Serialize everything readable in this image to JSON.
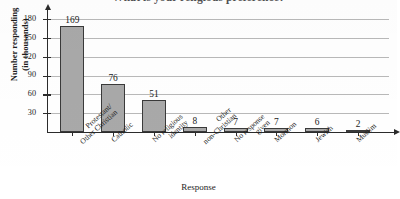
{
  "chart_data": {
    "type": "bar",
    "title": "What is your religious preference?",
    "xlabel": "Response",
    "ylabel_line1": "Number responding",
    "ylabel_line2": "(in thousands)",
    "categories": [
      "Protestant/ Other Christian",
      "Catholic",
      "No religious identity",
      "Other non-Christian",
      "No response given",
      "Mormon",
      "Jewish",
      "Muslim"
    ],
    "category_lines": [
      [
        "Protestant/",
        "Other Christian"
      ],
      [
        "Catholic",
        ""
      ],
      [
        "No religious",
        "identity"
      ],
      [
        "Other",
        "non-Christian"
      ],
      [
        "No response",
        "given"
      ],
      [
        "Mormon",
        ""
      ],
      [
        "Jewish",
        ""
      ],
      [
        "Muslim",
        ""
      ]
    ],
    "values": [
      169,
      76,
      51,
      8,
      7,
      7,
      6,
      2
    ],
    "value_labels": [
      "169",
      "76",
      "51",
      "8",
      "7",
      "7",
      "6",
      "2"
    ],
    "ylim": [
      0,
      190
    ],
    "yticks": [
      30,
      60,
      90,
      120,
      150,
      180
    ],
    "ytick_labels": [
      "30",
      "60",
      "90",
      "120",
      "150",
      "180"
    ],
    "grid": true,
    "legend": "none",
    "bar_color": "#a9a9a9",
    "bar_border_color": "#3a3a3a",
    "gridline_color": "#b9b9b9",
    "axis_color": "#2b2b2b"
  }
}
